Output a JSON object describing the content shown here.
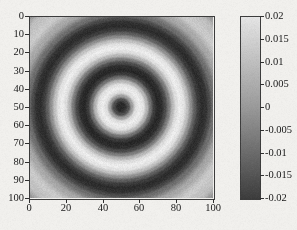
{
  "figure": {
    "title": "",
    "background_color": "#f2f1ee",
    "axis_color": "#2e2e2e"
  },
  "axes": {
    "x": {
      "label": "",
      "ticks": [
        "0",
        "20",
        "40",
        "60",
        "80",
        "100"
      ],
      "tick_values": [
        0,
        20,
        40,
        60,
        80,
        100
      ],
      "range": [
        0,
        100
      ]
    },
    "y": {
      "label": "",
      "ticks": [
        "0",
        "10",
        "20",
        "30",
        "40",
        "50",
        "60",
        "70",
        "80",
        "90",
        "100"
      ],
      "tick_values": [
        0,
        10,
        20,
        30,
        40,
        50,
        60,
        70,
        80,
        90,
        100
      ],
      "range": [
        0,
        100
      ],
      "inverted": true
    }
  },
  "colorbar": {
    "ticks": [
      "0.02",
      "0.015",
      "0.01",
      "0.005",
      "0",
      "-0.005",
      "-0.01",
      "-0.015",
      "-0.02"
    ],
    "tick_values": [
      0.02,
      0.015,
      0.01,
      0.005,
      0,
      -0.005,
      -0.01,
      -0.015,
      -0.02
    ],
    "vmin": -0.02,
    "vmax": 0.02,
    "colormap": "gray",
    "orientation": "vertical",
    "low_color": "#2b2b2b",
    "high_color": "#efefef"
  },
  "chart_data": {
    "type": "heatmap",
    "title": "",
    "xlabel": "",
    "ylabel": "",
    "xlim": [
      0,
      100
    ],
    "ylim": [
      100,
      0
    ],
    "grid": false,
    "legend": "colorbar-right",
    "colormap": "gray",
    "vmin": -0.02,
    "vmax": 0.02,
    "nx": 101,
    "ny": 101,
    "center": [
      50,
      50
    ],
    "radial_profile": {
      "r": [
        0,
        2,
        4,
        6,
        8,
        10,
        12,
        14,
        16,
        18,
        20,
        22,
        24,
        26,
        28,
        30,
        32,
        34,
        36,
        38,
        40,
        42,
        44,
        46,
        48,
        50,
        55,
        60,
        65,
        70
      ],
      "value": [
        -0.02,
        -0.019,
        -0.012,
        0.004,
        0.017,
        0.02,
        0.018,
        0.009,
        -0.005,
        -0.016,
        -0.02,
        -0.019,
        -0.013,
        -0.003,
        0.009,
        0.017,
        0.02,
        0.018,
        0.011,
        0.001,
        -0.009,
        -0.016,
        -0.019,
        -0.018,
        -0.013,
        -0.006,
        0.006,
        0.013,
        0.011,
        0.002
      ]
    },
    "features": [
      {
        "name": "central-dark-spot",
        "r_range": [
          0,
          4
        ],
        "value": -0.02
      },
      {
        "name": "bright-ring-1",
        "r_range": [
          6,
          14
        ],
        "value": 0.02
      },
      {
        "name": "dark-ring-1",
        "r_range": [
          16,
          26
        ],
        "value": -0.02
      },
      {
        "name": "bright-ring-2",
        "r_range": [
          28,
          38
        ],
        "value": 0.02
      },
      {
        "name": "dark-ring-2",
        "r_range": [
          40,
          50
        ],
        "value": -0.019
      },
      {
        "name": "bright-ring-3",
        "r_range": [
          52,
          62
        ],
        "value": 0.014
      },
      {
        "name": "background-corners",
        "r_range": [
          70,
          100
        ],
        "value": 0.0
      }
    ]
  }
}
